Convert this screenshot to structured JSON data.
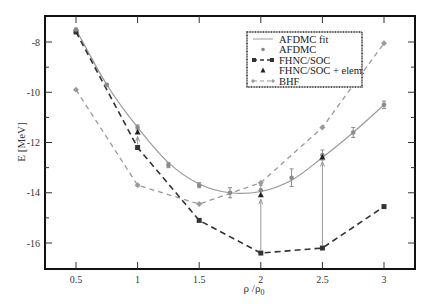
{
  "chart_data": {
    "type": "line",
    "title": "",
    "xlabel": "ρ /ρ",
    "xlabel_sub": "0",
    "ylabel": "E [MeV]",
    "xlim": [
      0.24,
      3.25
    ],
    "ylim": [
      -17,
      -7
    ],
    "xticks": [
      0.5,
      1,
      1.5,
      2,
      2.5,
      3
    ],
    "xtick_labels": [
      "0.5",
      "1",
      "1.5",
      "2",
      "2.5",
      "3"
    ],
    "yticks": [
      -8,
      -10,
      -12,
      -14,
      -16
    ],
    "ytick_labels": [
      "-8",
      "-10",
      "-12",
      "-14",
      "-16"
    ],
    "grid": false,
    "legend_position": "upper right (inside)",
    "series": [
      {
        "name": "AFDMC fit",
        "style": "solid line",
        "color": "#9a9a9a",
        "x": [
          0.5,
          0.75,
          1.0,
          1.25,
          1.5,
          1.75,
          2.0,
          2.25,
          2.5,
          2.75,
          3.0
        ],
        "values": [
          -7.5,
          -9.7,
          -11.4,
          -12.8,
          -13.65,
          -14.0,
          -13.95,
          -13.5,
          -12.6,
          -11.6,
          -10.5
        ]
      },
      {
        "name": "AFDMC",
        "style": "circle markers with error bars",
        "color": "#8a8a8a",
        "x": [
          0.5,
          0.75,
          1.0,
          1.25,
          1.5,
          1.75,
          2.0,
          2.25,
          2.5,
          2.75,
          3.0
        ],
        "values": [
          -7.5,
          -9.7,
          -11.4,
          -12.9,
          -13.7,
          -14.0,
          -13.9,
          -13.4,
          -12.5,
          -11.6,
          -10.5
        ],
        "errors": [
          0.05,
          0.05,
          0.1,
          0.1,
          0.1,
          0.2,
          0.2,
          0.35,
          0.2,
          0.2,
          0.15
        ]
      },
      {
        "name": "FHNC/SOC",
        "style": "dashed line with square markers",
        "color": "#333333",
        "x": [
          0.5,
          1.0,
          1.5,
          2.0,
          2.5,
          3.0
        ],
        "values": [
          -7.6,
          -12.2,
          -15.1,
          -16.4,
          -16.2,
          -14.55
        ]
      },
      {
        "name": "FHNC/SOC + elem.",
        "style": "triangle markers, arrows from FHNC/SOC",
        "color": "#222222",
        "x": [
          1.0,
          2.0,
          2.5
        ],
        "values": [
          -11.6,
          -14.1,
          -12.6
        ]
      },
      {
        "name": "BHF",
        "style": "dashed line with diamond markers",
        "color": "#9a9a9a",
        "x": [
          0.5,
          1.0,
          1.5,
          2.0,
          2.5,
          3.0
        ],
        "values": [
          -9.9,
          -13.7,
          -14.45,
          -13.6,
          -11.4,
          -8.05
        ]
      }
    ]
  },
  "legend": {
    "items": [
      {
        "label": "AFDMC fit"
      },
      {
        "label": "AFDMC"
      },
      {
        "label": "FHNC/SOC"
      },
      {
        "label": "FHNC/SOC + elem."
      },
      {
        "label": "BHF"
      }
    ]
  },
  "colors": {
    "frame": "#111111",
    "light_gray": "#9a9a9a",
    "dark": "#333333"
  }
}
